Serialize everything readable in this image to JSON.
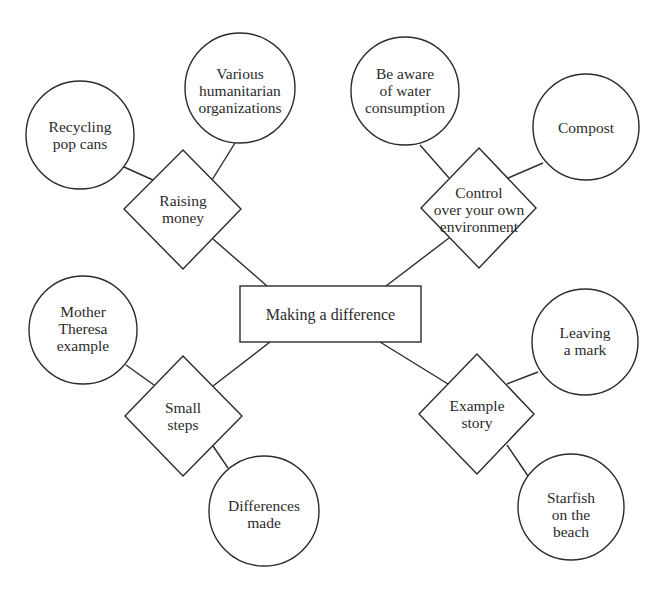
{
  "diagram": {
    "type": "mind-map",
    "colors": {
      "stroke": "#2b2b2b",
      "fill": "#ffffff",
      "text": "#2b2b2b",
      "background": "#ffffff"
    },
    "center": {
      "label": "Making a difference",
      "shape": "rectangle"
    },
    "branches": [
      {
        "label": "Raising money",
        "label_lines": "Raising\nmoney",
        "shape": "diamond",
        "leaves": [
          {
            "label": "Recycling pop cans",
            "label_lines": "Recycling\npop cans",
            "shape": "circle"
          },
          {
            "label": "Various humanitarian organizations",
            "label_lines": "Various\nhumanitarian\norganizations",
            "shape": "circle"
          }
        ]
      },
      {
        "label": "Control over your own environment",
        "label_lines": "Control\nover your own\nenvironment",
        "shape": "diamond",
        "leaves": [
          {
            "label": "Be aware of water consumption",
            "label_lines": "Be aware\nof water\nconsumption",
            "shape": "circle"
          },
          {
            "label": "Compost",
            "label_lines": "Compost",
            "shape": "circle"
          }
        ]
      },
      {
        "label": "Small steps",
        "label_lines": "Small\nsteps",
        "shape": "diamond",
        "leaves": [
          {
            "label": "Mother Theresa example",
            "label_lines": "Mother\nTheresa\nexample",
            "shape": "circle"
          },
          {
            "label": "Differences made",
            "label_lines": "Differences\nmade",
            "shape": "circle"
          }
        ]
      },
      {
        "label": "Example story",
        "label_lines": "Example\nstory",
        "shape": "diamond",
        "leaves": [
          {
            "label": "Leaving a mark",
            "label_lines": "Leaving\na mark",
            "shape": "circle"
          },
          {
            "label": "Starfish on the beach",
            "label_lines": "Starfish\non the\nbeach",
            "shape": "circle"
          }
        ]
      }
    ]
  }
}
